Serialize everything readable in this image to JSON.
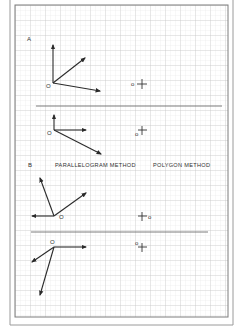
{
  "worksheet": {
    "colors": {
      "background": "#ffffff",
      "frame": "#8a8a8a",
      "grid_minor": "#dcdcdc",
      "grid_major": "#b8b8b8",
      "ink": "#2a2a2a",
      "divider": "#6e6e6e"
    },
    "grid": {
      "minor_spacing_px": 5,
      "major_every": 3
    },
    "section_a": {
      "label": "A",
      "diagrams": [
        {
          "origin_label": "O",
          "vectors": [
            {
              "direction": "up",
              "from": [
                53,
                83
              ],
              "to": [
                53,
                45
              ]
            },
            {
              "direction": "up-right",
              "from": [
                53,
                83
              ],
              "to": [
                85,
                58
              ]
            },
            {
              "direction": "right-down",
              "from": [
                53,
                83
              ],
              "to": [
                100,
                91
              ]
            }
          ],
          "answer_marker": {
            "label": "o",
            "symbol": "+"
          }
        },
        {
          "origin_label": "O",
          "vectors": [
            {
              "direction": "up",
              "from": [
                54,
                130
              ],
              "to": [
                54,
                115
              ]
            },
            {
              "direction": "right",
              "from": [
                54,
                130
              ],
              "to": [
                86,
                130
              ]
            },
            {
              "direction": "right-down",
              "from": [
                54,
                130
              ],
              "to": [
                101,
                154
              ]
            }
          ],
          "answer_marker": {
            "label": "o",
            "symbol": "+"
          }
        }
      ]
    },
    "section_b": {
      "label": "B",
      "left_heading": "PARALLELOGRAM METHOD",
      "right_heading": "POLYGON METHOD",
      "diagrams": [
        {
          "origin_label": "O",
          "vectors": [
            {
              "direction": "up-left",
              "from": [
                54,
                216
              ],
              "to": [
                40,
                178
              ]
            },
            {
              "direction": "up-right",
              "from": [
                54,
                216
              ],
              "to": [
                86,
                193
              ]
            },
            {
              "direction": "left",
              "from": [
                54,
                216
              ],
              "to": [
                32,
                216
              ]
            }
          ],
          "answer_marker": {
            "label": "o",
            "symbol": "+"
          }
        },
        {
          "origin_label": "O",
          "vectors": [
            {
              "direction": "right",
              "from": [
                54,
                247
              ],
              "to": [
                86,
                247
              ]
            },
            {
              "direction": "down-left",
              "from": [
                54,
                247
              ],
              "to": [
                32,
                262
              ]
            },
            {
              "direction": "down",
              "from": [
                54,
                247
              ],
              "to": [
                40,
                295
              ]
            }
          ],
          "answer_marker": {
            "label": "o",
            "symbol": "+"
          }
        }
      ]
    }
  }
}
